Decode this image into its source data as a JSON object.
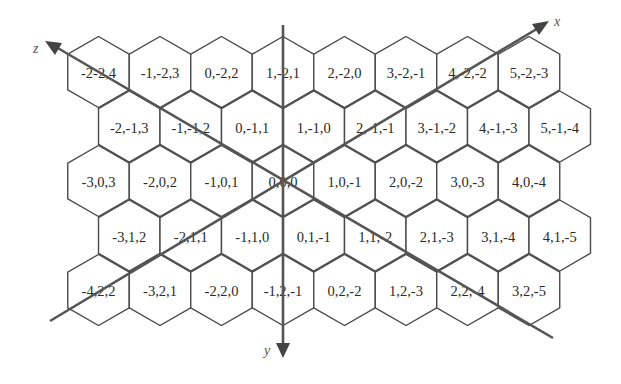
{
  "figure": {
    "origin_label": "0,0,0",
    "axes": [
      {
        "name": "x",
        "label": "x"
      },
      {
        "name": "y",
        "label": "y"
      },
      {
        "name": "z",
        "label": "z"
      }
    ],
    "colors": {
      "line": "#4a4a4a",
      "axis": "#555555",
      "text": "#2a2a2a",
      "background": "#ffffff"
    }
  },
  "rows": [
    {
      "row": 0,
      "cells": [
        "-2-2,4",
        "-1,-2,3",
        "0,-2,2",
        "1,-2,1",
        "2,-2,0",
        "3,-2,-1",
        "4,-2,-2",
        "5,-2,-3"
      ]
    },
    {
      "row": 1,
      "cells": [
        "-2,-1,3",
        "-1,-1,2",
        "0,-1,1",
        "1,-1,0",
        "2,-1,-1",
        "3,-1,-2",
        "4,-1,-3",
        "5,-1,-4"
      ]
    },
    {
      "row": 2,
      "cells": [
        "-3,0,3",
        "-2,0,2",
        "-1,0,1",
        "0,0,0",
        "1,0,-1",
        "2,0,-2",
        "3,0,-3",
        "4,0,-4"
      ]
    },
    {
      "row": 3,
      "cells": [
        "-3,1,2",
        "-2,1,1",
        "-1,1,0",
        "0,1,-1",
        "1,1,-2",
        "2,1,-3",
        "3,1,-4",
        "4,1,-5"
      ]
    },
    {
      "row": 4,
      "cells": [
        "-4,2,2",
        "-3,2,1",
        "-2,2,0",
        "-1,2,-1",
        "0,2,-2",
        "1,2,-3",
        "2,2,-4",
        "3,2,-5"
      ]
    }
  ]
}
